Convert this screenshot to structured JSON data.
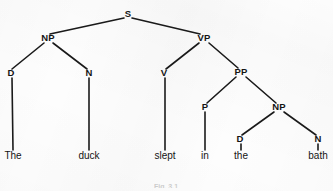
{
  "figure": {
    "type": "syntax-tree",
    "sentence": "The duck slept in the bath",
    "caption": "Fig. 3.1",
    "ink_color": "#1a1a1a",
    "background_color": "#fdfdfd"
  },
  "nodes": [
    {
      "id": "S",
      "label": "S",
      "x": 128,
      "y": 16
    },
    {
      "id": "NP1",
      "label": "NP",
      "x": 48,
      "y": 40
    },
    {
      "id": "VP",
      "label": "VP",
      "x": 204,
      "y": 40
    },
    {
      "id": "D1",
      "label": "D",
      "x": 11,
      "y": 75
    },
    {
      "id": "N1",
      "label": "N",
      "x": 89,
      "y": 75
    },
    {
      "id": "V",
      "label": "V",
      "x": 164,
      "y": 75
    },
    {
      "id": "PP",
      "label": "PP",
      "x": 241,
      "y": 74
    },
    {
      "id": "P",
      "label": "P",
      "x": 205,
      "y": 109
    },
    {
      "id": "NP2",
      "label": "NP",
      "x": 279,
      "y": 109
    },
    {
      "id": "D2",
      "label": "D",
      "x": 240,
      "y": 141
    },
    {
      "id": "N2",
      "label": "N",
      "x": 318,
      "y": 141
    }
  ],
  "leaves": [
    {
      "id": "the1",
      "word": "The",
      "x": 13,
      "y": 158,
      "parent": "D1"
    },
    {
      "id": "duck",
      "word": "duck",
      "x": 89,
      "y": 158,
      "parent": "N1"
    },
    {
      "id": "slept",
      "word": "slept",
      "x": 165,
      "y": 158,
      "parent": "V"
    },
    {
      "id": "in",
      "word": "in",
      "x": 205,
      "y": 158,
      "parent": "P"
    },
    {
      "id": "the2",
      "word": "the",
      "x": 241,
      "y": 158,
      "parent": "D2"
    },
    {
      "id": "bath",
      "word": "bath",
      "x": 318,
      "y": 158,
      "parent": "N2"
    }
  ],
  "edges": [
    {
      "from": "S",
      "to": "NP1",
      "x1": 124,
      "y1": 18,
      "x2": 50,
      "y2": 34
    },
    {
      "from": "S",
      "to": "VP",
      "x1": 132,
      "y1": 18,
      "x2": 200,
      "y2": 34
    },
    {
      "from": "NP1",
      "to": "D1",
      "x1": 44,
      "y1": 43,
      "x2": 12,
      "y2": 69
    },
    {
      "from": "NP1",
      "to": "N1",
      "x1": 53,
      "y1": 43,
      "x2": 87,
      "y2": 69
    },
    {
      "from": "VP",
      "to": "V",
      "x1": 199,
      "y1": 43,
      "x2": 166,
      "y2": 69
    },
    {
      "from": "VP",
      "to": "PP",
      "x1": 209,
      "y1": 43,
      "x2": 238,
      "y2": 68
    },
    {
      "from": "PP",
      "to": "P",
      "x1": 236,
      "y1": 77,
      "x2": 207,
      "y2": 103
    },
    {
      "from": "PP",
      "to": "NP2",
      "x1": 246,
      "y1": 77,
      "x2": 276,
      "y2": 103
    },
    {
      "from": "NP2",
      "to": "D2",
      "x1": 274,
      "y1": 112,
      "x2": 242,
      "y2": 135
    },
    {
      "from": "NP2",
      "to": "N2",
      "x1": 284,
      "y1": 112,
      "x2": 316,
      "y2": 135
    },
    {
      "from": "D1",
      "to": "the1",
      "x1": 12,
      "y1": 78,
      "x2": 13,
      "y2": 150
    },
    {
      "from": "N1",
      "to": "duck",
      "x1": 89,
      "y1": 78,
      "x2": 89,
      "y2": 150
    },
    {
      "from": "V",
      "to": "slept",
      "x1": 165,
      "y1": 78,
      "x2": 165,
      "y2": 150
    },
    {
      "from": "P",
      "to": "in",
      "x1": 205,
      "y1": 112,
      "x2": 205,
      "y2": 150
    },
    {
      "from": "D2",
      "to": "the2",
      "x1": 241,
      "y1": 144,
      "x2": 241,
      "y2": 150
    },
    {
      "from": "N2",
      "to": "bath",
      "x1": 318,
      "y1": 144,
      "x2": 318,
      "y2": 150
    }
  ]
}
